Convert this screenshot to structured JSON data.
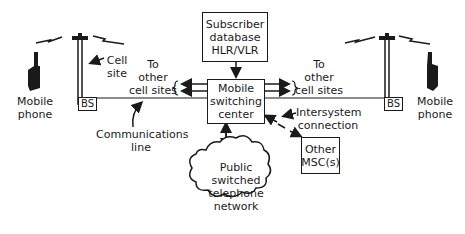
{
  "diagram": {
    "subscriber_db": {
      "line1": "Subscriber",
      "line2": "database",
      "line3": "HLR/VLR"
    },
    "msc": {
      "line1": "Mobile",
      "line2": "switching",
      "line3": "center"
    },
    "pstn": {
      "line1": "Public",
      "line2": "switched",
      "line3": "telephone",
      "line4": "network"
    },
    "other_msc": {
      "line1": "Other",
      "line2": "MSC(s)"
    },
    "left_phone": {
      "line1": "Mobile",
      "line2": "phone"
    },
    "right_phone": {
      "line1": "Mobile",
      "line2": "phone"
    },
    "cell_site": {
      "line1": "Cell",
      "line2": "site"
    },
    "left_bs": "BS",
    "right_bs": "BS",
    "left_other_sites": {
      "line1": "To",
      "line2": "other",
      "line3": "cell sites"
    },
    "right_other_sites": {
      "line1": "To",
      "line2": "other",
      "line3": "cell sites"
    },
    "comm_line": {
      "line1": "Communications",
      "line2": "line"
    },
    "intersystem": {
      "line1": "Intersystem",
      "line2": "connection"
    }
  }
}
